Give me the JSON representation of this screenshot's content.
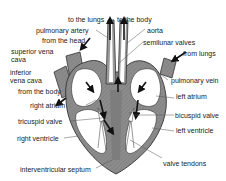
{
  "diagram": {
    "colors": {
      "wall": "#8c8c8c",
      "wall_dark": "#6e6e6e",
      "chamber": "#ffffff",
      "line": "#333333",
      "arrow": "#111111",
      "text": "#222222"
    },
    "labels": {
      "to_the_lungs": "to the lungs",
      "to_the_body": "to the body",
      "pulmonary_artery": "pulmonary artery",
      "aorta": "aorta",
      "from_the_head": "from the head",
      "semilunar_valves": "semilunar valves",
      "superior_vena_cava_1": "superior vena",
      "superior_vena_cava_2": "cava",
      "from_lungs": "from lungs",
      "inferior_vena_cava_1": "inferior",
      "inferior_vena_cava_2": "vena cava",
      "pulmonary_vein": "pulmonary vein",
      "from_the_body": "from the body",
      "left_atrium": "left atrium",
      "right_atrium": "right atrium",
      "bicuspid_valve": "bicuspid valve",
      "tricuspid_valve": "tricuspid valve",
      "left_ventricle": "left ventricle",
      "right_ventricle": "right ventricle",
      "valve_tendons": "valve tendons",
      "interventricular_septum": "interventricular septum"
    }
  }
}
